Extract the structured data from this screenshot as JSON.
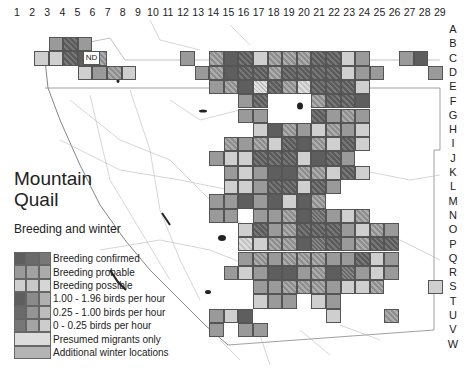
{
  "title": {
    "line1": "Mountain",
    "line2": "Quail"
  },
  "subtitle": "Breeding and winter",
  "nd_label": "ND",
  "columns": [
    "1",
    "2",
    "3",
    "4",
    "5",
    "6",
    "7",
    "8",
    "9",
    "10",
    "11",
    "12",
    "13",
    "14",
    "15",
    "16",
    "17",
    "18",
    "19",
    "20",
    "21",
    "22",
    "23",
    "24",
    "25",
    "26",
    "27",
    "28",
    "29"
  ],
  "rows": [
    "A",
    "B",
    "C",
    "D",
    "E",
    "F",
    "G",
    "H",
    "I",
    "J",
    "K",
    "L",
    "M",
    "N",
    "O",
    "P",
    "Q",
    "R",
    "S",
    "T",
    "U",
    "V",
    "W"
  ],
  "legend": [
    {
      "label": "Breeding confirmed",
      "swatch": [
        "#5e5e5e",
        "#6a6a6a",
        "#777"
      ]
    },
    {
      "label": "Breeding probable",
      "swatch": [
        "#9a9a9a",
        "#a2a2a2",
        "#ababab"
      ]
    },
    {
      "label": "Breeding possible",
      "swatch": [
        "#cfcfcf",
        "#c8c8c8",
        "#d6d6d6"
      ]
    },
    {
      "label": "1.00 - 1.96 birds per hour",
      "swatch": [
        "#5e5e5e",
        "#8a8a8a",
        "#b0b0b0"
      ]
    },
    {
      "label": "0.25 - 1.00 birds per hour",
      "swatch": [
        "#6a6a6a",
        "#949494",
        "#bcbcbc"
      ]
    },
    {
      "label": "0 - 0.25 birds per hour",
      "swatch": [
        "#777",
        "#a4a4a4",
        "#cdcdcd"
      ]
    },
    {
      "label": "Presumed migrants only",
      "swatch": [
        "#dcdcdc"
      ]
    },
    {
      "label": "Additional winter locations",
      "swatch": [
        "#b4b4b4"
      ]
    }
  ],
  "cells": [
    [
      "3",
      "B",
      "p"
    ],
    [
      "4",
      "B",
      "ch"
    ],
    [
      "5",
      "B",
      "p"
    ],
    [
      "2",
      "C",
      "s"
    ],
    [
      "3",
      "C",
      "s"
    ],
    [
      "4",
      "C",
      "ch"
    ],
    [
      "5",
      "C",
      "c"
    ],
    [
      "6",
      "C",
      "ph"
    ],
    [
      "5",
      "D",
      "s"
    ],
    [
      "6",
      "D",
      "p"
    ],
    [
      "7",
      "D",
      "ph"
    ],
    [
      "8",
      "D",
      "s"
    ],
    [
      "12",
      "C",
      "p"
    ],
    [
      "14",
      "C",
      "ph"
    ],
    [
      "15",
      "C",
      "c"
    ],
    [
      "16",
      "C",
      "ch"
    ],
    [
      "17",
      "C",
      "s"
    ],
    [
      "18",
      "C",
      "ph"
    ],
    [
      "19",
      "C",
      "ph"
    ],
    [
      "20",
      "C",
      "ph"
    ],
    [
      "21",
      "C",
      "ch"
    ],
    [
      "22",
      "C",
      "ch"
    ],
    [
      "23",
      "C",
      "s"
    ],
    [
      "24",
      "C",
      "p"
    ],
    [
      "27",
      "C",
      "p"
    ],
    [
      "28",
      "C",
      "c"
    ],
    [
      "13",
      "D",
      "p"
    ],
    [
      "14",
      "D",
      "ph"
    ],
    [
      "15",
      "D",
      "c"
    ],
    [
      "16",
      "D",
      "ch"
    ],
    [
      "17",
      "D",
      "ch"
    ],
    [
      "18",
      "D",
      "ph"
    ],
    [
      "19",
      "D",
      "ch"
    ],
    [
      "20",
      "D",
      "ch"
    ],
    [
      "21",
      "D",
      "ch"
    ],
    [
      "22",
      "D",
      "ch"
    ],
    [
      "23",
      "D",
      "s"
    ],
    [
      "24",
      "D",
      "p"
    ],
    [
      "25",
      "D",
      "p"
    ],
    [
      "29",
      "D",
      "p"
    ],
    [
      "14",
      "E",
      "p"
    ],
    [
      "15",
      "E",
      "ph"
    ],
    [
      "16",
      "E",
      "c"
    ],
    [
      "17",
      "E",
      "sx"
    ],
    [
      "18",
      "E",
      "ch"
    ],
    [
      "19",
      "E",
      "ph"
    ],
    [
      "20",
      "E",
      "sh"
    ],
    [
      "21",
      "E",
      "ch"
    ],
    [
      "22",
      "E",
      "ch"
    ],
    [
      "23",
      "E",
      "ch"
    ],
    [
      "24",
      "E",
      "s"
    ],
    [
      "16",
      "F",
      "p"
    ],
    [
      "17",
      "F",
      "ch"
    ],
    [
      "21",
      "F",
      "ph"
    ],
    [
      "22",
      "F",
      "ch"
    ],
    [
      "23",
      "F",
      "ch"
    ],
    [
      "24",
      "F",
      "c"
    ],
    [
      "16",
      "G",
      "p"
    ],
    [
      "17",
      "G",
      "p"
    ],
    [
      "21",
      "G",
      "ch"
    ],
    [
      "22",
      "G",
      "p"
    ],
    [
      "23",
      "G",
      "ph"
    ],
    [
      "24",
      "G",
      "p"
    ],
    [
      "17",
      "H",
      "s"
    ],
    [
      "18",
      "H",
      "c"
    ],
    [
      "19",
      "H",
      "ph"
    ],
    [
      "20",
      "H",
      "p"
    ],
    [
      "21",
      "H",
      "s"
    ],
    [
      "22",
      "H",
      "ph"
    ],
    [
      "23",
      "H",
      "p"
    ],
    [
      "24",
      "H",
      "s"
    ],
    [
      "15",
      "I",
      "ph"
    ],
    [
      "16",
      "I",
      "p"
    ],
    [
      "17",
      "I",
      "ph"
    ],
    [
      "18",
      "I",
      "s"
    ],
    [
      "19",
      "I",
      "ch"
    ],
    [
      "20",
      "I",
      "c"
    ],
    [
      "21",
      "I",
      "ph"
    ],
    [
      "22",
      "I",
      "s"
    ],
    [
      "23",
      "I",
      "ch"
    ],
    [
      "24",
      "I",
      "s"
    ],
    [
      "14",
      "J",
      "p"
    ],
    [
      "15",
      "J",
      "s"
    ],
    [
      "16",
      "J",
      "s"
    ],
    [
      "17",
      "J",
      "ch"
    ],
    [
      "18",
      "J",
      "ch"
    ],
    [
      "19",
      "J",
      "ch"
    ],
    [
      "20",
      "J",
      "s"
    ],
    [
      "21",
      "J",
      "c"
    ],
    [
      "22",
      "J",
      "ch"
    ],
    [
      "23",
      "J",
      "p"
    ],
    [
      "15",
      "K",
      "p"
    ],
    [
      "16",
      "K",
      "s"
    ],
    [
      "17",
      "K",
      "p"
    ],
    [
      "18",
      "K",
      "c"
    ],
    [
      "19",
      "K",
      "c"
    ],
    [
      "20",
      "K",
      "ph"
    ],
    [
      "21",
      "K",
      "ph"
    ],
    [
      "22",
      "K",
      "s"
    ],
    [
      "23",
      "K",
      "ch"
    ],
    [
      "24",
      "K",
      "s"
    ],
    [
      "15",
      "L",
      "s"
    ],
    [
      "16",
      "L",
      "s"
    ],
    [
      "17",
      "L",
      "p"
    ],
    [
      "18",
      "L",
      "ch"
    ],
    [
      "19",
      "L",
      "ch"
    ],
    [
      "20",
      "L",
      "s"
    ],
    [
      "21",
      "L",
      "ch"
    ],
    [
      "22",
      "L",
      "p"
    ],
    [
      "14",
      "M",
      "p"
    ],
    [
      "15",
      "M",
      "p"
    ],
    [
      "16",
      "M",
      "c"
    ],
    [
      "17",
      "M",
      "p"
    ],
    [
      "18",
      "M",
      "c"
    ],
    [
      "19",
      "M",
      "s"
    ],
    [
      "20",
      "M",
      "c"
    ],
    [
      "21",
      "M",
      "ph"
    ],
    [
      "14",
      "N",
      "p"
    ],
    [
      "15",
      "N",
      "p"
    ],
    [
      "17",
      "N",
      "p"
    ],
    [
      "18",
      "N",
      "p"
    ],
    [
      "19",
      "N",
      "ph"
    ],
    [
      "20",
      "N",
      "c"
    ],
    [
      "21",
      "N",
      "cx"
    ],
    [
      "22",
      "N",
      "p"
    ],
    [
      "23",
      "N",
      "s"
    ],
    [
      "24",
      "N",
      "ph"
    ],
    [
      "16",
      "O",
      "s"
    ],
    [
      "17",
      "O",
      "ch"
    ],
    [
      "18",
      "O",
      "p"
    ],
    [
      "19",
      "O",
      "ph"
    ],
    [
      "20",
      "O",
      "ch"
    ],
    [
      "21",
      "O",
      "ch"
    ],
    [
      "22",
      "O",
      "ch"
    ],
    [
      "23",
      "O",
      "p"
    ],
    [
      "24",
      "O",
      "s"
    ],
    [
      "25",
      "O",
      "ph"
    ],
    [
      "26",
      "O",
      "p"
    ],
    [
      "16",
      "P",
      "sh"
    ],
    [
      "17",
      "P",
      "s"
    ],
    [
      "18",
      "P",
      "ph"
    ],
    [
      "19",
      "P",
      "ph"
    ],
    [
      "20",
      "P",
      "c"
    ],
    [
      "21",
      "P",
      "cx"
    ],
    [
      "22",
      "P",
      "ch"
    ],
    [
      "23",
      "P",
      "p"
    ],
    [
      "24",
      "P",
      "ph"
    ],
    [
      "25",
      "P",
      "ch"
    ],
    [
      "26",
      "P",
      "ch"
    ],
    [
      "16",
      "Q",
      "p"
    ],
    [
      "17",
      "Q",
      "ph"
    ],
    [
      "18",
      "Q",
      "p"
    ],
    [
      "19",
      "Q",
      "ph"
    ],
    [
      "20",
      "Q",
      "ph"
    ],
    [
      "21",
      "Q",
      "ph"
    ],
    [
      "22",
      "Q",
      "p"
    ],
    [
      "23",
      "Q",
      "p"
    ],
    [
      "24",
      "Q",
      "ch"
    ],
    [
      "25",
      "Q",
      "s"
    ],
    [
      "26",
      "Q",
      "p"
    ],
    [
      "15",
      "R",
      "p"
    ],
    [
      "16",
      "R",
      "s"
    ],
    [
      "17",
      "R",
      "p"
    ],
    [
      "18",
      "R",
      "c"
    ],
    [
      "19",
      "R",
      "c"
    ],
    [
      "20",
      "R",
      "p"
    ],
    [
      "21",
      "R",
      "ph"
    ],
    [
      "22",
      "R",
      "c"
    ],
    [
      "23",
      "R",
      "cx"
    ],
    [
      "24",
      "R",
      "p"
    ],
    [
      "25",
      "R",
      "s"
    ],
    [
      "26",
      "R",
      "p"
    ],
    [
      "17",
      "S",
      "p"
    ],
    [
      "18",
      "S",
      "p"
    ],
    [
      "19",
      "S",
      "ph"
    ],
    [
      "20",
      "S",
      "ph"
    ],
    [
      "21",
      "S",
      "ph"
    ],
    [
      "22",
      "S",
      "p"
    ],
    [
      "23",
      "S",
      "s"
    ],
    [
      "24",
      "S",
      "s"
    ],
    [
      "25",
      "S",
      "ph"
    ],
    [
      "29",
      "S",
      "s"
    ],
    [
      "17",
      "T",
      "s"
    ],
    [
      "18",
      "T",
      "p"
    ],
    [
      "19",
      "T",
      "p"
    ],
    [
      "21",
      "T",
      "s"
    ],
    [
      "22",
      "T",
      "p"
    ],
    [
      "14",
      "U",
      "p"
    ],
    [
      "15",
      "U",
      "s"
    ],
    [
      "16",
      "U",
      "c"
    ],
    [
      "22",
      "U",
      "s"
    ],
    [
      "26",
      "U",
      "ph"
    ],
    [
      "14",
      "V",
      "p"
    ],
    [
      "16",
      "V",
      "p"
    ],
    [
      "17",
      "V",
      "p"
    ]
  ]
}
